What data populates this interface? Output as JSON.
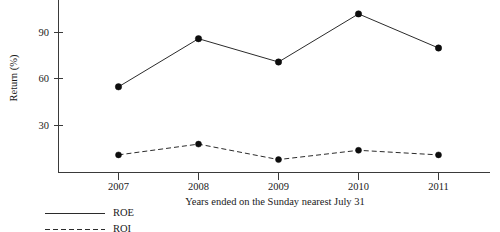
{
  "chart_data": {
    "type": "line",
    "title": "",
    "xlabel": "Years ended on the Sunday nearest July 31",
    "ylabel": "Return (%)",
    "categories": [
      "2007",
      "2008",
      "2009",
      "2010",
      "2011"
    ],
    "yticks": [
      30,
      60,
      90
    ],
    "ytick_labels": [
      "30",
      "60",
      "90"
    ],
    "ylim": [
      0,
      108
    ],
    "grid": false,
    "legend_position": "below-left",
    "series": [
      {
        "name": "ROE",
        "style": "solid",
        "marker": "filled-circle",
        "values": [
          55,
          86,
          71,
          102,
          80
        ]
      },
      {
        "name": "ROI",
        "style": "dashed",
        "marker": "filled-circle",
        "values": [
          11,
          18,
          8,
          14,
          11
        ]
      }
    ]
  },
  "axes": {
    "y_axis_title": "Return (%)",
    "x_axis_title": "Years ended on the Sunday nearest July 31"
  },
  "legend": {
    "entries": [
      {
        "label": "ROE",
        "style": "solid"
      },
      {
        "label": "ROI",
        "style": "dashed"
      }
    ]
  }
}
